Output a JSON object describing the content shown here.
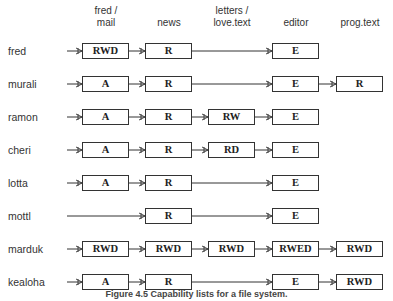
{
  "columns": [
    {
      "label_line1": "fred /",
      "label_line2": "mail"
    },
    {
      "label_line1": "news",
      "label_line2": ""
    },
    {
      "label_line1": "letters /",
      "label_line2": "love.text"
    },
    {
      "label_line1": "editor",
      "label_line2": ""
    },
    {
      "label_line1": "prog.text",
      "label_line2": ""
    }
  ],
  "rows": [
    {
      "user": "fred",
      "caps": [
        "RWD",
        "R",
        null,
        "E",
        null
      ]
    },
    {
      "user": "murali",
      "caps": [
        "A",
        "R",
        null,
        "E",
        "R"
      ]
    },
    {
      "user": "ramon",
      "caps": [
        "A",
        "R",
        "RW",
        "E",
        null
      ]
    },
    {
      "user": "cheri",
      "caps": [
        "A",
        "R",
        "RD",
        "E",
        null
      ]
    },
    {
      "user": "lotta",
      "caps": [
        "A",
        "R",
        null,
        "E",
        null
      ]
    },
    {
      "user": "mottl",
      "caps": [
        null,
        "R",
        null,
        "E",
        null
      ]
    },
    {
      "user": "marduk",
      "caps": [
        "RWD",
        "RWD",
        "RWD",
        "RWED",
        "RWD"
      ]
    },
    {
      "user": "kealoha",
      "caps": [
        "A",
        "R",
        null,
        "E",
        "RWD"
      ]
    }
  ],
  "caption": "Figure 4.5  Capability lists for a file system."
}
